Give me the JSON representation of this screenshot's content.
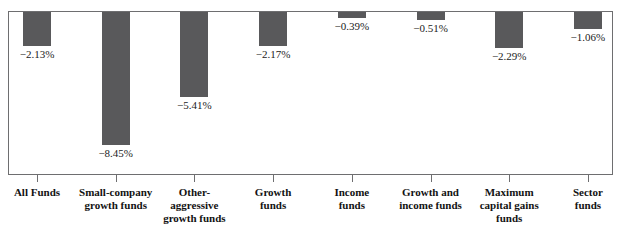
{
  "chart_data": {
    "type": "bar",
    "title": "",
    "subtitle": "",
    "xlabel": "",
    "ylabel": "",
    "grid": false,
    "legend": "none",
    "orientation": "vertical",
    "zero_line": "top of plot frame",
    "ylim": [
      -9.0,
      0.0
    ],
    "units": "percent",
    "categories": [
      "All Funds",
      "Small-company growth funds",
      "Other-aggressive growth funds",
      "Growth funds",
      "Income funds",
      "Growth and income funds",
      "Maximum capital gains funds",
      "Sector funds"
    ],
    "category_lines": [
      [
        "All Funds"
      ],
      [
        "Small-company",
        "growth funds"
      ],
      [
        "Other-",
        "aggressive",
        "growth funds"
      ],
      [
        "Growth",
        "funds"
      ],
      [
        "Income",
        "funds"
      ],
      [
        "Growth and",
        "income funds"
      ],
      [
        "Maximum",
        "capital gains",
        "funds"
      ],
      [
        "Sector",
        "funds"
      ]
    ],
    "values": [
      -2.13,
      -8.45,
      -5.41,
      -2.17,
      -0.39,
      -0.51,
      -2.29,
      -1.06
    ],
    "value_labels": [
      "−2.13%",
      "−8.45%",
      "−5.41%",
      "−2.17%",
      "−0.39%",
      "−0.51%",
      "−2.29%",
      "−1.06%"
    ],
    "bar_color": "#59595b",
    "frame_color": "#6e6e70",
    "text_color": "#121212",
    "background": "#ffffff"
  }
}
